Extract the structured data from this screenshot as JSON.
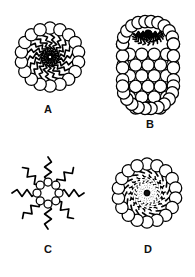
{
  "figure": {
    "background_color": "#ffffff",
    "stroke_color": "#000000",
    "fill_color": "#ffffff",
    "core_fill_color": "#111111",
    "width": 195,
    "height": 277
  },
  "panels": [
    {
      "id": "a",
      "label": "A",
      "name": "spherical-micelle",
      "center": [
        50,
        57
      ],
      "head_count": 18,
      "head_ring_radius": 29,
      "head_radius": 6.2,
      "tail_count": 18,
      "tail_inner_radius": 2,
      "tail_outer_radius": 23,
      "tail_twist_deg": 46,
      "tail_zigzag_segments": 7,
      "tail_zigzag_amplitude": 2.2,
      "has_dark_core": false,
      "label_pos": [
        48,
        110
      ]
    },
    {
      "id": "b",
      "label": "B",
      "name": "cylindrical-rod-micelle",
      "capsule": {
        "x": 117,
        "y": 16,
        "width": 62,
        "height": 98,
        "corner_radius": 28
      },
      "head_radius": 6.2,
      "head_rows": 9,
      "head_cols": 5,
      "tail_origin": [
        148,
        33
      ],
      "tail_count": 15,
      "tail_spread_deg": 188,
      "tail_length": 22,
      "tail_zigzag_segments": 6,
      "tail_zigzag_amplitude": 1.8,
      "label_pos": [
        150,
        125
      ]
    },
    {
      "id": "c",
      "label": "C",
      "name": "reverse-inverted-micelle",
      "center": [
        48,
        193
      ],
      "head_count": 8,
      "head_ring_radius": 11,
      "head_radius": 4.0,
      "tail_count": 8,
      "tail_inner_radius": 11,
      "tail_outer_radius": 36,
      "tail_zigzag_segments": 5,
      "tail_zigzag_amplitude": 3.4,
      "has_dark_core": false,
      "label_pos": [
        48,
        250
      ]
    },
    {
      "id": "d",
      "label": "D",
      "name": "micelle-with-solubilized-core",
      "center": [
        147,
        193
      ],
      "head_count": 18,
      "head_ring_radius": 29,
      "head_radius": 6.2,
      "tail_count": 18,
      "tail_inner_radius": 3,
      "tail_outer_radius": 23,
      "tail_twist_deg": 46,
      "tail_zigzag_segments": 7,
      "tail_zigzag_amplitude": 2.2,
      "has_dark_core": true,
      "core_radius_x": 17,
      "core_radius_y": 13,
      "core_rotation_deg": -12,
      "label_pos": [
        148,
        250
      ]
    }
  ]
}
